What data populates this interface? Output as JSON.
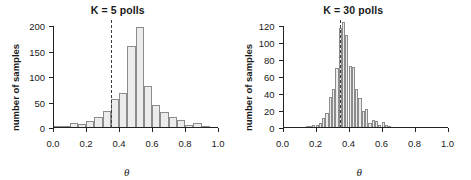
{
  "figure": {
    "background": "#ffffff",
    "bar_fill": "#ececec",
    "bar_stroke": "#8c8c8c",
    "axis_color": "#222222",
    "vline_color": "#3d3d3d"
  },
  "chart_data": [
    {
      "type": "bar",
      "panel": "left",
      "title": "K = 5 polls",
      "xlabel": "θ",
      "ylabel": "number of samples",
      "xlim": [
        0.0,
        1.0
      ],
      "ylim": [
        0,
        200
      ],
      "xticks": [
        0.0,
        0.2,
        0.4,
        0.6,
        0.8,
        1.0
      ],
      "xticklabels": [
        "0.0",
        "0.2",
        "0.4",
        "0.6",
        "0.8",
        "1.0"
      ],
      "yticks": [
        0,
        50,
        100,
        150,
        200
      ],
      "yticklabels": [
        "0",
        "50",
        "100",
        "150",
        "200"
      ],
      "grid": false,
      "legend": false,
      "bin_width": 0.05,
      "bin_edges": [
        0.0,
        0.05,
        0.1,
        0.15,
        0.2,
        0.25,
        0.3,
        0.35,
        0.4,
        0.45,
        0.5,
        0.55,
        0.6,
        0.65,
        0.7,
        0.75,
        0.8,
        0.85,
        0.9,
        0.95,
        1.0
      ],
      "categories": [
        "0.00-0.05",
        "0.05-0.10",
        "0.10-0.15",
        "0.15-0.20",
        "0.20-0.25",
        "0.25-0.30",
        "0.30-0.35",
        "0.35-0.40",
        "0.40-0.45",
        "0.45-0.50",
        "0.50-0.55",
        "0.55-0.60",
        "0.60-0.65",
        "0.65-0.70",
        "0.70-0.75",
        "0.75-0.80",
        "0.80-0.85",
        "0.85-0.90",
        "0.90-0.95",
        "0.95-1.00"
      ],
      "values": [
        2,
        4,
        9,
        7,
        13,
        22,
        34,
        56,
        68,
        161,
        198,
        82,
        46,
        31,
        21,
        15,
        5,
        9,
        1,
        0
      ],
      "annotations": [
        {
          "type": "vline",
          "x": 0.35,
          "style": "dashed",
          "label": "true theta"
        }
      ]
    },
    {
      "type": "bar",
      "panel": "right",
      "title": "K = 30 polls",
      "xlabel": "θ",
      "ylabel": "number of samples",
      "xlim": [
        0.0,
        1.0
      ],
      "ylim": [
        0,
        120
      ],
      "xticks": [
        0.0,
        0.2,
        0.4,
        0.6,
        0.8,
        1.0
      ],
      "xticklabels": [
        "0.0",
        "0.2",
        "0.4",
        "0.6",
        "0.8",
        "1.0"
      ],
      "yticks": [
        0,
        20,
        40,
        60,
        80,
        100,
        120
      ],
      "yticklabels": [
        "0",
        "20",
        "40",
        "60",
        "80",
        "100",
        "120"
      ],
      "grid": false,
      "legend": false,
      "bin_width": 0.02,
      "bin_edges": [
        0.0,
        0.02,
        0.04,
        0.06,
        0.08,
        0.1,
        0.12,
        0.14,
        0.16,
        0.18,
        0.2,
        0.22,
        0.24,
        0.26,
        0.28,
        0.3,
        0.32,
        0.34,
        0.36,
        0.38,
        0.4,
        0.42,
        0.44,
        0.46,
        0.48,
        0.5,
        0.52,
        0.54,
        0.56,
        0.58,
        0.6,
        0.62,
        0.64,
        0.66,
        0.68,
        0.7,
        0.72,
        0.74,
        0.76,
        0.78,
        0.8,
        0.82,
        0.84,
        0.86,
        0.88,
        0.9,
        0.92,
        0.94,
        0.96,
        0.98,
        1.0
      ],
      "categories": [
        "0.00-0.02",
        "0.02-0.04",
        "0.04-0.06",
        "0.06-0.08",
        "0.08-0.10",
        "0.10-0.12",
        "0.12-0.14",
        "0.14-0.16",
        "0.16-0.18",
        "0.18-0.20",
        "0.20-0.22",
        "0.22-0.24",
        "0.24-0.26",
        "0.26-0.28",
        "0.28-0.30",
        "0.30-0.32",
        "0.32-0.34",
        "0.34-0.36",
        "0.36-0.38",
        "0.38-0.40",
        "0.40-0.42",
        "0.42-0.44",
        "0.44-0.46",
        "0.46-0.48",
        "0.48-0.50",
        "0.50-0.52",
        "0.52-0.54",
        "0.54-0.56",
        "0.56-0.58",
        "0.58-0.60",
        "0.60-0.62",
        "0.62-0.64",
        "0.64-0.66",
        "0.66-0.68",
        "0.68-0.70",
        "0.70-0.72",
        "0.72-0.74",
        "0.74-0.76",
        "0.76-0.78",
        "0.78-0.80",
        "0.80-0.82",
        "0.82-0.84",
        "0.84-0.86",
        "0.86-0.88",
        "0.88-0.90",
        "0.90-0.92",
        "0.92-0.94",
        "0.94-0.96",
        "0.96-0.98",
        "0.98-1.00"
      ],
      "values": [
        0,
        0,
        0,
        0,
        0,
        0,
        0,
        1,
        2,
        3,
        3,
        6,
        12,
        18,
        36,
        46,
        71,
        118,
        125,
        109,
        73,
        72,
        46,
        35,
        20,
        22,
        6,
        9,
        8,
        4,
        7,
        3,
        2,
        0,
        0,
        0,
        0,
        0,
        0,
        0,
        0,
        0,
        0,
        0,
        0,
        0,
        0,
        0,
        0,
        0
      ],
      "annotations": [
        {
          "type": "vline",
          "x": 0.35,
          "style": "dashed",
          "label": "true theta"
        }
      ]
    }
  ]
}
